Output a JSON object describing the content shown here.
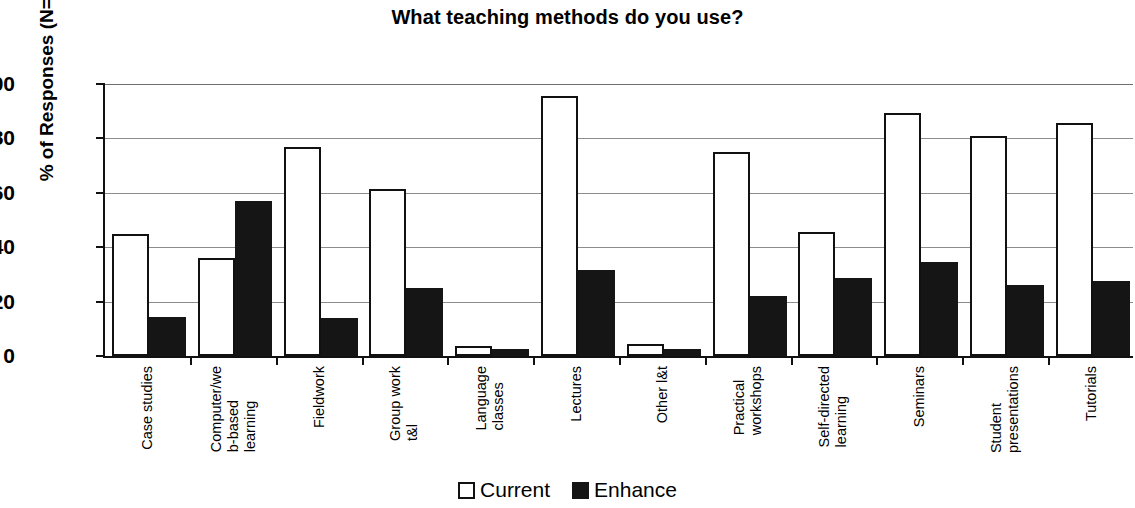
{
  "chart_data": {
    "type": "bar",
    "title": "What teaching methods do you use?",
    "xlabel": "",
    "ylabel": "% of Responses (N=98)",
    "ylim": [
      0,
      100
    ],
    "ytick_values": [
      100,
      80,
      60,
      40,
      20,
      0
    ],
    "ytick_labels": [
      "100",
      "80",
      "60",
      "40",
      "20",
      "0"
    ],
    "grid": true,
    "legend_position": "bottom-center",
    "categories": [
      "Case studies",
      "Computer/web-based learning",
      "Fieldwork",
      "Group work t&l",
      "Language classes",
      "Lectures",
      "Other l&t",
      "Practical workshops",
      "Self-directed learning",
      "Seminars",
      "Student presentations",
      "Tutorials"
    ],
    "category_label_lines": [
      [
        "Case studies"
      ],
      [
        "Computer/we",
        "b-based",
        "learning"
      ],
      [
        "Fieldwork"
      ],
      [
        "Group work",
        "t&l"
      ],
      [
        "Language",
        "classes"
      ],
      [
        "Lectures"
      ],
      [
        "Other l&t"
      ],
      [
        "Practical",
        "workshops"
      ],
      [
        "Self-directed",
        "learning"
      ],
      [
        "Seminars"
      ],
      [
        "Student",
        "presentations"
      ],
      [
        "Tutorials"
      ]
    ],
    "series": [
      {
        "name": "Current",
        "color": "#ffffff",
        "edge_color": "#111111",
        "values": [
          45,
          36,
          77,
          61.5,
          3.5,
          95.5,
          4.5,
          75,
          45.5,
          89.5,
          81,
          85.5
        ]
      },
      {
        "name": "Enhance",
        "color": "#151515",
        "edge_color": "#151515",
        "values": [
          14.5,
          57,
          14,
          25,
          2.5,
          31.5,
          2.5,
          22,
          28.5,
          34.5,
          26,
          27.5
        ]
      }
    ]
  },
  "legend": {
    "items": [
      {
        "label": "Current",
        "swatch": "open-square-swatch"
      },
      {
        "label": "Enhance",
        "swatch": "filled-square-swatch"
      }
    ]
  }
}
